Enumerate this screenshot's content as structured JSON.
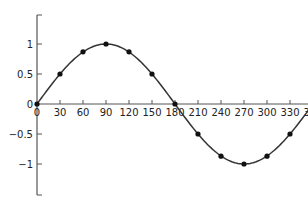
{
  "chart_data": {
    "type": "line",
    "title": "",
    "xlabel": "",
    "ylabel": "",
    "series": [
      {
        "name": "sin(x)",
        "x": [
          0,
          30,
          60,
          90,
          120,
          150,
          180,
          210,
          240,
          270,
          300,
          330,
          360
        ],
        "values": [
          0,
          0.5,
          0.87,
          1,
          0.87,
          0.5,
          0,
          -0.5,
          -0.87,
          -1,
          -0.87,
          -0.5,
          0
        ]
      }
    ],
    "x_ticks": [
      0,
      30,
      60,
      90,
      120,
      150,
      180,
      210,
      240,
      270,
      300,
      330,
      360
    ],
    "x_tick_labels": [
      "0",
      "30",
      "60",
      "90",
      "120",
      "150",
      "180",
      "210",
      "240",
      "270",
      "300",
      "330",
      "360"
    ],
    "y_ticks": [
      1,
      0.5,
      0,
      -0.5,
      -1
    ],
    "y_tick_labels": [
      "1",
      "0.5",
      "0",
      "−0.5",
      "−1"
    ],
    "xlim": [
      0,
      360
    ],
    "ylim": [
      -1.5,
      1.5
    ],
    "grid": false,
    "legend": "none",
    "markers": "filled-circle",
    "colors": {
      "line": "#333333",
      "marker": "#111111",
      "axis": "#555555"
    }
  }
}
